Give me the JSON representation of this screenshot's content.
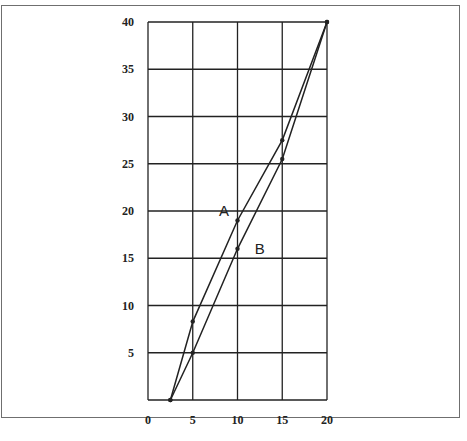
{
  "chart_data": {
    "type": "line",
    "title": "",
    "xlabel": "",
    "ylabel": "",
    "xlim": [
      0,
      20
    ],
    "ylim": [
      0,
      40
    ],
    "x_ticks": [
      "0",
      "5",
      "10",
      "15",
      "20"
    ],
    "y_ticks": [
      "5",
      "10",
      "15",
      "20",
      "25",
      "30",
      "35",
      "40"
    ],
    "grid": true,
    "legend": "none (inline labels)",
    "series": [
      {
        "name": "A",
        "points": [
          [
            2.5,
            0
          ],
          [
            5,
            8.3
          ],
          [
            10,
            19
          ],
          [
            15,
            27.5
          ],
          [
            20,
            40
          ]
        ]
      },
      {
        "name": "B",
        "points": [
          [
            2.5,
            0
          ],
          [
            5,
            5
          ],
          [
            10,
            16
          ],
          [
            15,
            25.5
          ],
          [
            20,
            40
          ]
        ]
      }
    ],
    "annotations": [
      {
        "text": "A",
        "x": 8.5,
        "y": 20
      },
      {
        "text": "B",
        "x": 12.5,
        "y": 16
      }
    ]
  },
  "colors": {
    "line": "#222222",
    "grid": "#222222",
    "frame": "#6f6f6f"
  }
}
